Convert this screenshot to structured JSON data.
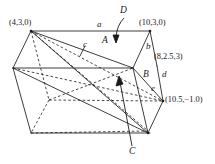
{
  "figure": {
    "type": "3d-prism-diagram",
    "background_color": "#ffffff",
    "line_color": "#1a1a1a",
    "coordinate_labels": [
      {
        "id": "top-left-vertex",
        "text": "(4,3,0)",
        "x": 9,
        "y": 19
      },
      {
        "id": "top-right-vertex",
        "text": "(10,3,0)",
        "x": 139,
        "y": 19
      },
      {
        "id": "right-upper-vertex",
        "text": "(8,2.5,3)",
        "x": 154,
        "y": 53
      },
      {
        "id": "right-lower-vertex",
        "text": "(10.5,−1.0)",
        "x": 165,
        "y": 96
      }
    ],
    "edge_labels": [
      {
        "id": "edge-a",
        "text": "a",
        "x": 97,
        "y": 23
      },
      {
        "id": "edge-b",
        "text": "b",
        "x": 146,
        "y": 44
      },
      {
        "id": "edge-c",
        "text": "c",
        "x": 83,
        "y": 43
      },
      {
        "id": "edge-d",
        "text": "d",
        "x": 162,
        "y": 72
      },
      {
        "id": "edge-e",
        "text": "e",
        "x": 152,
        "y": 86
      }
    ],
    "face_labels": [
      {
        "id": "face-A",
        "text": "A",
        "x": 103,
        "y": 38
      },
      {
        "id": "face-B",
        "text": "B",
        "x": 144,
        "y": 72
      }
    ],
    "callout_labels": [
      {
        "id": "callout-D",
        "text": "D",
        "x": 120,
        "y": 10
      },
      {
        "id": "callout-C",
        "text": "C",
        "x": 130,
        "y": 148
      }
    ]
  }
}
